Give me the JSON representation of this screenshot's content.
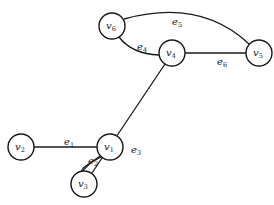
{
  "diagram": {
    "type": "undirected-graph",
    "nodes": [
      {
        "id": "v1",
        "label": "v",
        "sub": "1",
        "x": 110,
        "y": 147
      },
      {
        "id": "v2",
        "label": "v",
        "sub": "2",
        "x": 21,
        "y": 147
      },
      {
        "id": "v3",
        "label": "v",
        "sub": "3",
        "x": 84,
        "y": 184
      },
      {
        "id": "v4",
        "label": "v",
        "sub": "4",
        "x": 172,
        "y": 53
      },
      {
        "id": "v5",
        "label": "v",
        "sub": "5",
        "x": 259,
        "y": 53
      },
      {
        "id": "v6",
        "label": "v",
        "sub": "6",
        "x": 112,
        "y": 26
      }
    ],
    "edges": [
      {
        "id": "e1",
        "label": "e",
        "sub": "1",
        "from": "v2",
        "to": "v1",
        "lx": 67,
        "ly": 144
      },
      {
        "id": "e2",
        "label": "e",
        "sub": "2",
        "from": "v1",
        "to": "v3",
        "lx": 91,
        "ly": 162
      },
      {
        "id": "e3",
        "label": "e",
        "sub": "3",
        "from": "v4",
        "to": "v3",
        "lx": 133,
        "ly": 151
      },
      {
        "id": "e4",
        "label": "e",
        "sub": "4",
        "from": "v6",
        "to": "v4",
        "lx": 139,
        "ly": 48
      },
      {
        "id": "e5",
        "label": "e",
        "sub": "5",
        "from": "v6",
        "to": "v5",
        "lx": 172,
        "ly": 24
      },
      {
        "id": "e6",
        "label": "e",
        "sub": "6",
        "from": "v4",
        "to": "v5",
        "lx": 218,
        "ly": 64
      }
    ]
  }
}
